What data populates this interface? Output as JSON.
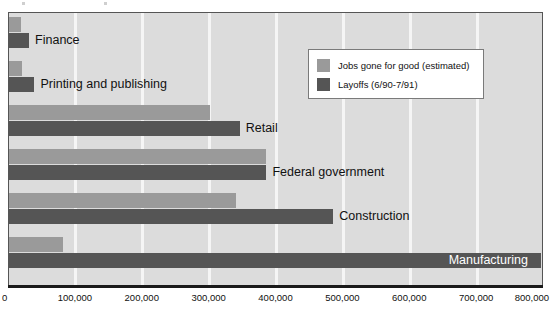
{
  "chart_data": {
    "type": "bar",
    "orientation": "horizontal",
    "title": "",
    "xlabel": "",
    "ylabel": "",
    "xlim": [
      0,
      800000
    ],
    "grid": true,
    "legend_position": "upper-right",
    "xticks": [
      "0",
      "100,000",
      "200,000",
      "300,000",
      "400,000",
      "500,000",
      "600,000",
      "700,000",
      "800,000"
    ],
    "xtick_values": [
      0,
      100000,
      200000,
      300000,
      400000,
      500000,
      600000,
      700000,
      800000
    ],
    "categories": [
      "Finance",
      "Printing and publishing",
      "Retail",
      "Federal government",
      "Construction",
      "Manufacturing"
    ],
    "series": [
      {
        "name": "Jobs gone for good (estimated)",
        "color": "#9a9a9a",
        "values": [
          18000,
          20000,
          300000,
          385000,
          340000,
          80000
        ]
      },
      {
        "name": "Layoffs (6/90-7/91)",
        "color": "#555555",
        "values": [
          30000,
          38000,
          345000,
          385000,
          485000,
          795000
        ]
      }
    ]
  },
  "legend": {
    "entries": [
      {
        "label": "Jobs gone for good (estimated)",
        "swatch": "light"
      },
      {
        "label": "Layoffs (6/90-7/91)",
        "swatch": "dark"
      }
    ]
  },
  "colors": {
    "light_bar": "#9a9a9a",
    "dark_bar": "#555555",
    "plot_background": "#dcdcdc",
    "gridline": "#f5f5f5",
    "axis": "#1a1a1a"
  }
}
